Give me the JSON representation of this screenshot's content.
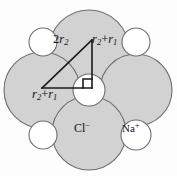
{
  "figure": {
    "name": "nacl-ionic-packing-diagram",
    "background_color": "#fdfdfd",
    "anion_fill": "#d2d2d2",
    "cation_fill": "#ffffff",
    "outline_color": "#6e6e6e",
    "line_color": "#1a1a1a",
    "width": 177,
    "height": 176
  },
  "labels": {
    "hypotenuse": "2r2",
    "vertical_leg": "r2+r1",
    "horizontal_leg": "r2+r1",
    "anion": "Cl-",
    "cation": "Na+"
  },
  "label_parts": {
    "hypotenuse": {
      "coefficient": "2",
      "symbol": "r",
      "subscript": "2"
    },
    "leg": {
      "symbol_a": "r",
      "subscript_a": "2",
      "operator": "+",
      "symbol_b": "r",
      "subscript_b": "1"
    },
    "anion": {
      "element": "Cl",
      "charge": "−"
    },
    "cation": {
      "element": "Na",
      "charge": "+"
    }
  },
  "ions": {
    "anions": [
      {
        "name": "anion-top",
        "cx": 89,
        "cy": 50,
        "r": 40
      },
      {
        "name": "anion-left",
        "cx": 42,
        "cy": 90,
        "r": 38
      },
      {
        "name": "anion-right",
        "cx": 136,
        "cy": 90,
        "r": 36
      },
      {
        "name": "anion-bottom",
        "cx": 89,
        "cy": 133,
        "r": 37
      }
    ],
    "cations": [
      {
        "name": "cation-center",
        "cx": 89,
        "cy": 90,
        "r": 16
      },
      {
        "name": "cation-top-left",
        "cx": 43,
        "cy": 42,
        "r": 14
      },
      {
        "name": "cation-top-right",
        "cx": 136,
        "cy": 42,
        "r": 14
      },
      {
        "name": "cation-bottom-left",
        "cx": 43,
        "cy": 135,
        "r": 14
      },
      {
        "name": "cation-bottom-right",
        "cx": 136,
        "cy": 135,
        "r": 15
      }
    ]
  },
  "triangle": {
    "apex_x": 92,
    "apex_y": 40,
    "corner_x": 92,
    "corner_y": 88,
    "end_x": 42,
    "end_y": 88,
    "right_angle_size": 9
  }
}
